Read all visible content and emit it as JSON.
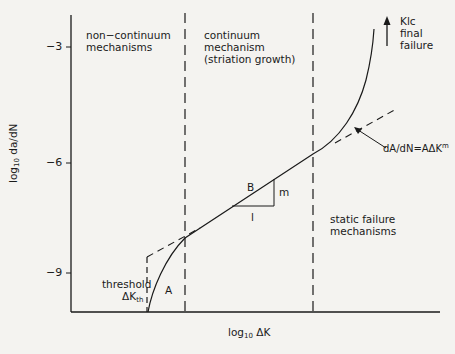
{
  "diagram": {
    "title": "",
    "axes": {
      "y_label_main": "log",
      "y_label_sub": "10",
      "y_label_rest": " da/dN",
      "x_label_main": "log",
      "x_label_sub": "10",
      "x_label_rest": " ΔK",
      "y_ticks": [
        {
          "label": "−3",
          "y": 47
        },
        {
          "label": "−6",
          "y": 163
        },
        {
          "label": "−9",
          "y": 273
        }
      ]
    },
    "regions": {
      "left": {
        "line1": "non−continuum",
        "line2": "mechanisms"
      },
      "middle": {
        "line1": "continuum",
        "line2": "mechanism",
        "line3": "(striation growth)"
      },
      "right": {
        "line1": "static failure",
        "line2": "mechanisms"
      }
    },
    "annotations": {
      "final_line1": "Klc",
      "final_line2": "final",
      "final_line3": "failure",
      "equation_main": "dA/dN=AΔK",
      "equation_sup": "m",
      "threshold_line1": "threshold",
      "threshold_main": "ΔK",
      "threshold_sub": "th",
      "region_A": "A",
      "region_B": "B",
      "slope_m": "m",
      "slope_run": "l"
    },
    "colors": {
      "background": "#f4f3f0",
      "ink": "#1a1a1a"
    }
  }
}
